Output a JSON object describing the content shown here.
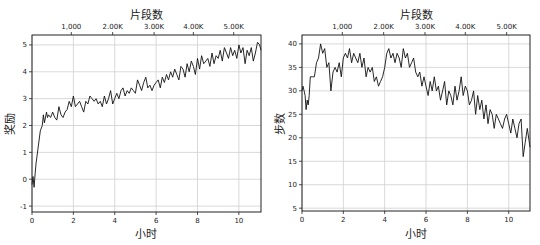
{
  "chart_data": [
    {
      "type": "line",
      "title": "",
      "xlabel": "小时",
      "ylabel": "奖励",
      "top_xlabel": "片段数",
      "xlim": [
        0,
        11.07
      ],
      "ylim": [
        -1.22,
        5.37
      ],
      "xticks": [
        0,
        2,
        4,
        6,
        8,
        10
      ],
      "xtick_labels": [
        "0",
        "2",
        "4",
        "6",
        "8",
        "10"
      ],
      "yticks": [
        -1,
        0,
        1,
        2,
        3,
        4,
        5
      ],
      "ytick_labels": [
        "-1",
        "0",
        "1",
        "2",
        "3",
        "4",
        "5"
      ],
      "top_xticks_hours": [
        1.9,
        3.9,
        5.9,
        7.8,
        9.75
      ],
      "top_xtick_labels": [
        "1,000",
        "2.00K",
        "3.00K",
        "4.00K",
        "5.00K"
      ],
      "grid": true,
      "legend": null,
      "series": [
        {
          "name": "奖励",
          "x": [
            0.0,
            0.05,
            0.1,
            0.15,
            0.2,
            0.3,
            0.4,
            0.5,
            0.55,
            0.6,
            0.7,
            0.75,
            0.8,
            0.9,
            1.0,
            1.1,
            1.2,
            1.3,
            1.4,
            1.5,
            1.6,
            1.7,
            1.8,
            1.9,
            2.0,
            2.1,
            2.2,
            2.3,
            2.4,
            2.5,
            2.6,
            2.7,
            2.8,
            2.9,
            3.0,
            3.1,
            3.2,
            3.3,
            3.4,
            3.5,
            3.6,
            3.7,
            3.8,
            3.9,
            4.0,
            4.1,
            4.2,
            4.3,
            4.4,
            4.5,
            4.6,
            4.7,
            4.8,
            4.9,
            5.0,
            5.1,
            5.2,
            5.3,
            5.4,
            5.5,
            5.6,
            5.7,
            5.8,
            5.9,
            6.0,
            6.1,
            6.2,
            6.3,
            6.4,
            6.5,
            6.6,
            6.7,
            6.8,
            6.9,
            7.0,
            7.1,
            7.2,
            7.3,
            7.4,
            7.5,
            7.6,
            7.7,
            7.8,
            7.9,
            8.0,
            8.1,
            8.2,
            8.3,
            8.4,
            8.5,
            8.6,
            8.7,
            8.8,
            8.9,
            9.0,
            9.1,
            9.2,
            9.3,
            9.4,
            9.5,
            9.6,
            9.7,
            9.8,
            9.9,
            10.0,
            10.1,
            10.2,
            10.3,
            10.4,
            10.5,
            10.6,
            10.7,
            10.8,
            10.9,
            11.0,
            11.07
          ],
          "y": [
            -0.2,
            0.1,
            -0.3,
            0.2,
            0.6,
            1.2,
            1.8,
            2.0,
            2.4,
            2.1,
            2.5,
            2.3,
            2.4,
            2.3,
            2.5,
            2.3,
            2.2,
            2.7,
            2.4,
            2.3,
            2.5,
            2.6,
            2.9,
            2.7,
            3.1,
            2.7,
            2.8,
            2.9,
            2.7,
            2.5,
            2.9,
            2.8,
            3.1,
            3.0,
            2.9,
            3.0,
            2.8,
            2.9,
            2.7,
            3.1,
            2.8,
            3.0,
            3.3,
            2.8,
            3.0,
            3.2,
            3.0,
            3.3,
            3.4,
            3.1,
            3.3,
            3.2,
            3.4,
            3.3,
            3.2,
            3.7,
            3.5,
            3.3,
            3.6,
            3.8,
            3.4,
            3.5,
            3.3,
            3.5,
            3.6,
            3.7,
            3.4,
            3.8,
            3.6,
            3.9,
            3.7,
            4.0,
            3.8,
            4.1,
            3.9,
            3.7,
            4.2,
            4.1,
            3.8,
            4.3,
            4.0,
            4.4,
            4.2,
            3.9,
            4.5,
            4.1,
            4.6,
            4.3,
            4.4,
            4.5,
            4.2,
            4.7,
            4.3,
            4.6,
            4.5,
            4.8,
            4.4,
            4.9,
            4.7,
            4.5,
            4.9,
            4.6,
            4.8,
            4.5,
            5.0,
            4.7,
            4.9,
            4.3,
            4.8,
            4.6,
            4.9,
            4.4,
            4.7,
            5.1,
            5.0,
            4.8
          ]
        }
      ]
    },
    {
      "type": "line",
      "title": "",
      "xlabel": "小时",
      "ylabel": "步数",
      "top_xlabel": "片段数",
      "xlim": [
        0,
        11.03
      ],
      "ylim": [
        4.4,
        41.9
      ],
      "xticks": [
        0,
        2,
        4,
        6,
        8,
        10
      ],
      "xtick_labels": [
        "0",
        "2",
        "4",
        "6",
        "8",
        "10"
      ],
      "yticks": [
        5,
        10,
        15,
        20,
        25,
        30,
        35,
        40
      ],
      "ytick_labels": [
        "5",
        "10",
        "15",
        "20",
        "25",
        "30",
        "35",
        "40"
      ],
      "top_xticks_hours": [
        1.95,
        3.95,
        5.95,
        7.9,
        9.9
      ],
      "top_xtick_labels": [
        "1,000",
        "2.00K",
        "3.00K",
        "4.00K",
        "5.00K"
      ],
      "grid": true,
      "legend": null,
      "series": [
        {
          "name": "步数",
          "x": [
            0.0,
            0.05,
            0.1,
            0.15,
            0.2,
            0.25,
            0.3,
            0.35,
            0.4,
            0.5,
            0.6,
            0.7,
            0.8,
            0.9,
            1.0,
            1.1,
            1.2,
            1.3,
            1.4,
            1.5,
            1.6,
            1.7,
            1.8,
            1.9,
            2.0,
            2.1,
            2.2,
            2.3,
            2.4,
            2.5,
            2.6,
            2.7,
            2.8,
            2.9,
            3.0,
            3.1,
            3.2,
            3.3,
            3.4,
            3.5,
            3.6,
            3.7,
            3.8,
            3.9,
            4.0,
            4.1,
            4.2,
            4.3,
            4.4,
            4.5,
            4.6,
            4.7,
            4.8,
            4.9,
            5.0,
            5.1,
            5.2,
            5.3,
            5.4,
            5.5,
            5.6,
            5.7,
            5.8,
            5.9,
            6.0,
            6.1,
            6.2,
            6.3,
            6.4,
            6.5,
            6.6,
            6.7,
            6.8,
            6.9,
            7.0,
            7.1,
            7.2,
            7.3,
            7.4,
            7.5,
            7.6,
            7.7,
            7.8,
            7.9,
            8.0,
            8.1,
            8.2,
            8.3,
            8.4,
            8.5,
            8.6,
            8.7,
            8.8,
            8.9,
            9.0,
            9.1,
            9.2,
            9.3,
            9.4,
            9.5,
            9.6,
            9.7,
            9.8,
            9.9,
            10.0,
            10.1,
            10.2,
            10.3,
            10.4,
            10.5,
            10.6,
            10.7,
            10.8,
            10.9,
            11.03
          ],
          "y": [
            30,
            31,
            30,
            29,
            26,
            28,
            27,
            29,
            33,
            33,
            33,
            36,
            37,
            40,
            38,
            39,
            35,
            36,
            30,
            34,
            35,
            34,
            36,
            33,
            37,
            38,
            37,
            39,
            36,
            38,
            37,
            36,
            38,
            35,
            37,
            33,
            35,
            34,
            35,
            32,
            33,
            31,
            32,
            33,
            35,
            38,
            39,
            37,
            38,
            36,
            38,
            37,
            35,
            39,
            37,
            38,
            35,
            36,
            37,
            34,
            33,
            34,
            31,
            33,
            31,
            29,
            32,
            30,
            33,
            30,
            31,
            28,
            30,
            32,
            27,
            30,
            29,
            27,
            31,
            28,
            30,
            33,
            29,
            31,
            30,
            27,
            28,
            30,
            25,
            29,
            26,
            28,
            24,
            27,
            23,
            26,
            25,
            22,
            25,
            24,
            23,
            22,
            24,
            25,
            23,
            21,
            24,
            22,
            20,
            23,
            24,
            16,
            19,
            22,
            18,
            21,
            20,
            17,
            19,
            22,
            18,
            20,
            21,
            17
          ]
        }
      ]
    }
  ]
}
